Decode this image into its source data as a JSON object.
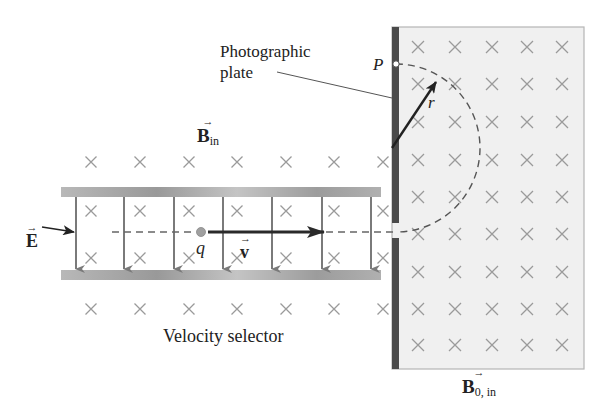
{
  "diagram": {
    "labels": {
      "photographic_plate_line1": "Photographic",
      "photographic_plate_line2": "plate",
      "point_p": "P",
      "radius": "r",
      "b_in": "B",
      "b_in_sub": "in",
      "e_field": "E",
      "charge": "q",
      "velocity": "v",
      "velocity_selector": "Velocity selector",
      "b0_in": "B",
      "b0_in_sub": "0, in"
    },
    "colors": {
      "plate_dark": "#4a4a4a",
      "field_region_fill": "#f0f0f0",
      "cross": "#9a9a9a",
      "capacitor_plate": "#a8a8a8",
      "e_arrow": "#7a7a7a",
      "beam": "#555555",
      "velocity_arrow": "#2a2a2a",
      "charge": "#999999"
    },
    "velocity_selector": {
      "plate_top_y": 187,
      "plate_bottom_y": 270,
      "plate_x_start": 61,
      "plate_x_end": 381,
      "e_arrow_x": [
        76,
        124,
        174,
        223,
        272,
        322,
        371
      ],
      "crosses_outside_rows_y": [
        162,
        309
      ],
      "crosses_inside_rows_y": [
        211,
        258
      ],
      "crosses_x": [
        91,
        140,
        189,
        237,
        286,
        334,
        383
      ]
    },
    "magnetic_region": {
      "x": 392,
      "y": 27,
      "width": 192,
      "height": 342,
      "crosses_x": [
        418,
        455,
        492,
        527,
        562
      ],
      "crosses_y": [
        47,
        84,
        122,
        160,
        197,
        234,
        272,
        309,
        345
      ],
      "semicircle_center": [
        396,
        148
      ],
      "semicircle_radius": 84,
      "slit_y": 232
    }
  }
}
